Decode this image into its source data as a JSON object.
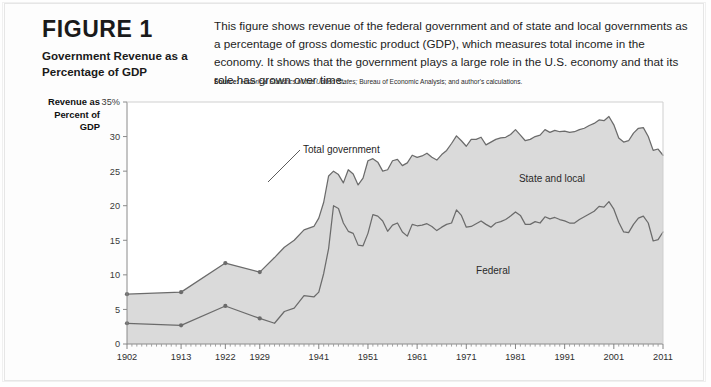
{
  "figure": {
    "label": "FIGURE",
    "number": "1",
    "title": "Government Revenue as a Percentage of GDP",
    "description": "This figure shows revenue of the federal government and of state and local governments as a percentage of gross domestic product (GDP), which measures total income in the economy. It shows that the government plays a large role in the U.S. economy and that its role has grown over time.",
    "source_label": "Source:",
    "source_italic": "Historical Statistics of the United States;",
    "source_rest": " Bureau of Economic Analysis; and author's calculations."
  },
  "axis": {
    "y_title": "Revenue as Percent of GDP",
    "y_ticks": [
      "0",
      "5",
      "10",
      "15",
      "20",
      "25",
      "30",
      "35%"
    ],
    "x_ticks": [
      "1902",
      "1913",
      "1922",
      "1929",
      "1941",
      "1951",
      "1961",
      "1971",
      "1981",
      "1991",
      "2001",
      "2011"
    ]
  },
  "annotations": {
    "total_government": "Total government",
    "state_and_local": "State and local",
    "federal": "Federal"
  },
  "colors": {
    "area_fill": "#d3d3d3",
    "line": "#6b6b6b",
    "axis": "#8a8a8a",
    "plot_bg": "#ffffff",
    "page_bg": "#fdfdfd"
  },
  "chart_data": {
    "type": "area",
    "title": "Government Revenue as a Percentage of GDP",
    "xlabel": "",
    "ylabel": "Revenue as Percent of GDP",
    "ylim": [
      0,
      35
    ],
    "xlim": [
      1902,
      2011
    ],
    "grid": false,
    "legend": "inline-annotations",
    "x_tick_values": [
      1902,
      1913,
      1922,
      1929,
      1941,
      1951,
      1961,
      1971,
      1981,
      1991,
      2001,
      2011
    ],
    "y_tick_values": [
      0,
      5,
      10,
      15,
      20,
      25,
      30,
      35
    ],
    "series": [
      {
        "name": "Total government",
        "stacking": "top-boundary",
        "x": [
          1902,
          1913,
          1922,
          1929,
          1932,
          1934,
          1936,
          1938,
          1940,
          1941,
          1942,
          1943,
          1944,
          1945,
          1946,
          1947,
          1948,
          1949,
          1950,
          1951,
          1952,
          1953,
          1954,
          1955,
          1956,
          1957,
          1958,
          1959,
          1960,
          1961,
          1962,
          1963,
          1964,
          1965,
          1966,
          1967,
          1968,
          1969,
          1970,
          1971,
          1972,
          1973,
          1974,
          1975,
          1976,
          1977,
          1978,
          1979,
          1980,
          1981,
          1982,
          1983,
          1984,
          1985,
          1986,
          1987,
          1988,
          1989,
          1990,
          1991,
          1992,
          1993,
          1994,
          1995,
          1996,
          1997,
          1998,
          1999,
          2000,
          2001,
          2002,
          2003,
          2004,
          2005,
          2006,
          2007,
          2008,
          2009,
          2010,
          2011
        ],
        "y": [
          7.2,
          7.5,
          11.7,
          10.4,
          12.5,
          14.0,
          15.0,
          16.5,
          17.0,
          18.2,
          20.5,
          24.3,
          25.0,
          24.5,
          23.3,
          25.2,
          24.6,
          23.0,
          24.0,
          26.5,
          26.8,
          26.3,
          25.0,
          25.2,
          26.5,
          26.7,
          25.8,
          26.2,
          27.3,
          27.0,
          27.2,
          27.6,
          27.0,
          26.6,
          27.4,
          28.0,
          29.0,
          30.1,
          29.4,
          28.6,
          29.6,
          29.6,
          29.9,
          28.8,
          29.2,
          29.6,
          29.8,
          29.9,
          30.3,
          31.0,
          30.2,
          29.4,
          29.6,
          30.0,
          30.2,
          31.0,
          30.6,
          30.9,
          30.7,
          30.8,
          30.6,
          30.7,
          31.0,
          31.2,
          31.6,
          31.9,
          32.4,
          32.3,
          32.9,
          31.7,
          29.8,
          29.2,
          29.4,
          30.5,
          31.2,
          31.3,
          30.0,
          28.0,
          28.2,
          27.3
        ]
      },
      {
        "name": "Federal",
        "stacking": "bottom-band",
        "x": [
          1902,
          1913,
          1922,
          1929,
          1932,
          1934,
          1936,
          1938,
          1940,
          1941,
          1942,
          1943,
          1944,
          1945,
          1946,
          1947,
          1948,
          1949,
          1950,
          1951,
          1952,
          1953,
          1954,
          1955,
          1956,
          1957,
          1958,
          1959,
          1960,
          1961,
          1962,
          1963,
          1964,
          1965,
          1966,
          1967,
          1968,
          1969,
          1970,
          1971,
          1972,
          1973,
          1974,
          1975,
          1976,
          1977,
          1978,
          1979,
          1980,
          1981,
          1982,
          1983,
          1984,
          1985,
          1986,
          1987,
          1988,
          1989,
          1990,
          1991,
          1992,
          1993,
          1994,
          1995,
          1996,
          1997,
          1998,
          1999,
          2000,
          2001,
          2002,
          2003,
          2004,
          2005,
          2006,
          2007,
          2008,
          2009,
          2010,
          2011
        ],
        "y": [
          3.0,
          2.7,
          5.5,
          3.7,
          3.0,
          4.7,
          5.2,
          7.0,
          6.8,
          7.5,
          10.2,
          13.8,
          20.0,
          19.6,
          17.5,
          16.3,
          16.0,
          14.3,
          14.2,
          16.0,
          18.7,
          18.5,
          17.8,
          16.3,
          17.2,
          17.5,
          16.2,
          15.6,
          17.3,
          17.1,
          17.2,
          17.4,
          17.0,
          16.4,
          16.9,
          17.3,
          17.5,
          19.4,
          18.6,
          16.9,
          17.0,
          17.4,
          17.8,
          17.3,
          16.9,
          17.5,
          17.7,
          18.0,
          18.5,
          19.1,
          18.6,
          17.3,
          17.3,
          17.7,
          17.5,
          18.4,
          18.1,
          18.3,
          18.0,
          17.8,
          17.5,
          17.5,
          18.0,
          18.4,
          18.8,
          19.2,
          19.9,
          19.8,
          20.6,
          19.5,
          17.6,
          16.2,
          16.1,
          17.3,
          18.2,
          18.5,
          17.5,
          14.9,
          15.1,
          16.2
        ]
      }
    ]
  }
}
